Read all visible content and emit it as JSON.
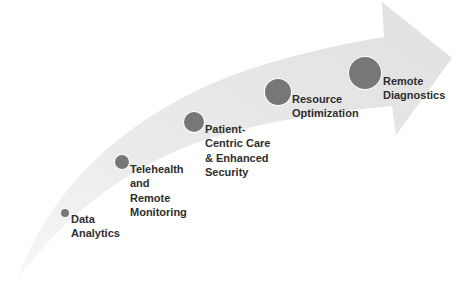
{
  "diagram": {
    "type": "curved-progress-arrow",
    "arrow": {
      "fill_start": "#f5f5f5",
      "fill_end": "#e2e2e2",
      "direction": "bottom-left to top-right"
    },
    "dot_color": "#777777",
    "text_color": "#2e2e2e",
    "milestones": [
      {
        "order": 1,
        "lines": [
          "Data",
          "Analytics"
        ],
        "label": "Data Analytics",
        "dot": {
          "cx": 65,
          "cy": 213,
          "r": 4
        },
        "text_pos": {
          "x": 71,
          "y": 212
        }
      },
      {
        "order": 2,
        "lines": [
          "Telehealth",
          "and",
          "Remote",
          "Monitoring"
        ],
        "label": "Telehealth and Remote Monitoring",
        "dot": {
          "cx": 122,
          "cy": 162,
          "r": 7
        },
        "text_pos": {
          "x": 130,
          "y": 162
        }
      },
      {
        "order": 3,
        "lines": [
          "Patient-",
          "Centric Care",
          "& Enhanced",
          "Security"
        ],
        "label": "Patient-Centric Care & Enhanced Security",
        "dot": {
          "cx": 194,
          "cy": 122,
          "r": 10
        },
        "text_pos": {
          "x": 205,
          "y": 122
        }
      },
      {
        "order": 4,
        "lines": [
          "Resource",
          "Optimization"
        ],
        "label": "Resource Optimization",
        "dot": {
          "cx": 278,
          "cy": 92,
          "r": 13
        },
        "text_pos": {
          "x": 292,
          "y": 92
        }
      },
      {
        "order": 5,
        "lines": [
          "Remote",
          "Diagnostics"
        ],
        "label": "Remote Diagnostics",
        "dot": {
          "cx": 365,
          "cy": 73,
          "r": 16
        },
        "text_pos": {
          "x": 383,
          "y": 74
        }
      }
    ]
  }
}
